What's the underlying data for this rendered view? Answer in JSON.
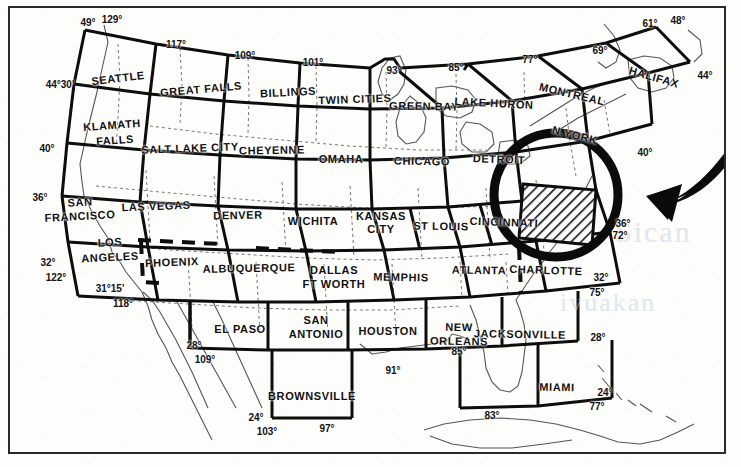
{
  "document": {
    "title": "Sectional Aeronautical Chart Index - United States",
    "description": "Index map of U.S. sectional aeronautical charts with the Washington chart highlighted by hatching and a heavy circle, indicated by a large curved arrow."
  },
  "watermarks": [
    "Sican",
    "ivuakan",
    "m"
  ],
  "highlight": {
    "chart_name": "WASHINGTON",
    "style": "diagonal-hatch",
    "circle_color": "#111111",
    "arrow": "curved-left-arrow"
  },
  "charts": [
    {
      "name": "SEATTLE",
      "x": 118,
      "y": 78,
      "rot": -7
    },
    {
      "name": "GREAT FALLS",
      "x": 201,
      "y": 89,
      "rot": -5
    },
    {
      "name": "BILLINGS",
      "x": 288,
      "y": 92,
      "rot": -3
    },
    {
      "name": "TWIN CITIES",
      "x": 355,
      "y": 99,
      "rot": -2
    },
    {
      "name": "GREEN BAY",
      "x": 424,
      "y": 106,
      "rot": 1
    },
    {
      "name": "LAKE HURON",
      "x": 494,
      "y": 103,
      "rot": 3
    },
    {
      "name": "MONTREAL",
      "x": 572,
      "y": 94,
      "rot": 13
    },
    {
      "name": "HALIFAX",
      "x": 654,
      "y": 77,
      "rot": 16
    },
    {
      "name": "KLAMATH",
      "x": 112,
      "y": 125,
      "rot": -4
    },
    {
      "name": "FALLS",
      "x": 115,
      "y": 140,
      "rot": -4
    },
    {
      "name": "SALT LAKE CITY",
      "x": 190,
      "y": 148,
      "rot": -2
    },
    {
      "name": "CHEYENNE",
      "x": 272,
      "y": 150,
      "rot": -1
    },
    {
      "name": "OMAHA",
      "x": 341,
      "y": 159,
      "rot": 0
    },
    {
      "name": "CHICAGO",
      "x": 422,
      "y": 161,
      "rot": 1
    },
    {
      "name": "DETROIT",
      "x": 499,
      "y": 159,
      "rot": 2
    },
    {
      "name": "N.YORK",
      "x": 575,
      "y": 135,
      "rot": 14
    },
    {
      "name": "SAN",
      "x": 80,
      "y": 202,
      "rot": -3
    },
    {
      "name": "FRANCISCO",
      "x": 80,
      "y": 216,
      "rot": -3
    },
    {
      "name": "LAS VEGAS",
      "x": 156,
      "y": 206,
      "rot": -2
    },
    {
      "name": "DENVER",
      "x": 238,
      "y": 215,
      "rot": -1
    },
    {
      "name": "WICHITA",
      "x": 313,
      "y": 221,
      "rot": 0
    },
    {
      "name": "KANSAS",
      "x": 381,
      "y": 216,
      "rot": 0
    },
    {
      "name": "CITY",
      "x": 381,
      "y": 229,
      "rot": 0
    },
    {
      "name": "ST LOUIS",
      "x": 441,
      "y": 226,
      "rot": 1
    },
    {
      "name": "CINCINNATI",
      "x": 504,
      "y": 222,
      "rot": 2
    },
    {
      "name": "LOS",
      "x": 110,
      "y": 242,
      "rot": -3
    },
    {
      "name": "ANGELES",
      "x": 110,
      "y": 257,
      "rot": -3
    },
    {
      "name": "PHOENIX",
      "x": 172,
      "y": 262,
      "rot": -2
    },
    {
      "name": "ALBUQUERQUE",
      "x": 249,
      "y": 268,
      "rot": -1
    },
    {
      "name": "DALLAS",
      "x": 334,
      "y": 270,
      "rot": 0
    },
    {
      "name": "FT WORTH",
      "x": 334,
      "y": 284,
      "rot": 0
    },
    {
      "name": "MEMPHIS",
      "x": 401,
      "y": 277,
      "rot": 1
    },
    {
      "name": "ATLANTA",
      "x": 479,
      "y": 270,
      "rot": 1
    },
    {
      "name": "CHARLOTTE",
      "x": 546,
      "y": 270,
      "rot": 2
    },
    {
      "name": "EL PASO",
      "x": 240,
      "y": 329,
      "rot": 0
    },
    {
      "name": "SAN",
      "x": 316,
      "y": 320,
      "rot": 0
    },
    {
      "name": "ANTONIO",
      "x": 316,
      "y": 334,
      "rot": 0
    },
    {
      "name": "HOUSTON",
      "x": 388,
      "y": 331,
      "rot": 0
    },
    {
      "name": "NEW",
      "x": 459,
      "y": 327,
      "rot": 1
    },
    {
      "name": "ORLEANS",
      "x": 459,
      "y": 341,
      "rot": 1
    },
    {
      "name": "JACKSONVILLE",
      "x": 520,
      "y": 334,
      "rot": 1
    },
    {
      "name": "BROWNSVILLE",
      "x": 312,
      "y": 396,
      "rot": 0
    },
    {
      "name": "MIAMI",
      "x": 557,
      "y": 387,
      "rot": 1
    }
  ],
  "coordinates": [
    {
      "label": "49°",
      "x": 88,
      "y": 22
    },
    {
      "label": "129°",
      "x": 112,
      "y": 19
    },
    {
      "label": "117°",
      "x": 176,
      "y": 44
    },
    {
      "label": "109°",
      "x": 245,
      "y": 55
    },
    {
      "label": "101°",
      "x": 313,
      "y": 62
    },
    {
      "label": "93°",
      "x": 394,
      "y": 70
    },
    {
      "label": "85°",
      "x": 456,
      "y": 67
    },
    {
      "label": "77°",
      "x": 530,
      "y": 59
    },
    {
      "label": "69°",
      "x": 600,
      "y": 50
    },
    {
      "label": "61°",
      "x": 650,
      "y": 23
    },
    {
      "label": "48°",
      "x": 678,
      "y": 20
    },
    {
      "label": "44°",
      "x": 705,
      "y": 75
    },
    {
      "label": "44°30'",
      "x": 60,
      "y": 84
    },
    {
      "label": "40°",
      "x": 47,
      "y": 148
    },
    {
      "label": "36°",
      "x": 40,
      "y": 197
    },
    {
      "label": "32°",
      "x": 48,
      "y": 262
    },
    {
      "label": "122°",
      "x": 56,
      "y": 277
    },
    {
      "label": "31°15'",
      "x": 110,
      "y": 288
    },
    {
      "label": "118°",
      "x": 123,
      "y": 303
    },
    {
      "label": "40°",
      "x": 645,
      "y": 152
    },
    {
      "label": "36°",
      "x": 623,
      "y": 223
    },
    {
      "label": "72°",
      "x": 620,
      "y": 235
    },
    {
      "label": "32°",
      "x": 601,
      "y": 277
    },
    {
      "label": "75°",
      "x": 597,
      "y": 292
    },
    {
      "label": "28°",
      "x": 598,
      "y": 337
    },
    {
      "label": "24°",
      "x": 605,
      "y": 392
    },
    {
      "label": "77°",
      "x": 597,
      "y": 406
    },
    {
      "label": "83°",
      "x": 492,
      "y": 415
    },
    {
      "label": "85°",
      "x": 459,
      "y": 351
    },
    {
      "label": "91°",
      "x": 393,
      "y": 370
    },
    {
      "label": "28°",
      "x": 194,
      "y": 345
    },
    {
      "label": "109°",
      "x": 205,
      "y": 359
    },
    {
      "label": "24°",
      "x": 256,
      "y": 417
    },
    {
      "label": "103°",
      "x": 267,
      "y": 431
    },
    {
      "label": "97°",
      "x": 327,
      "y": 428
    }
  ]
}
